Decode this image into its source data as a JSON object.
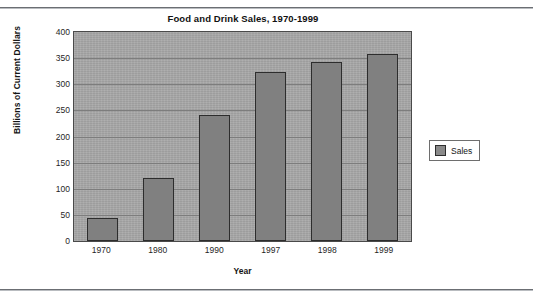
{
  "chart_data": {
    "type": "bar",
    "title": "Food and Drink Sales, 1970-1999",
    "xlabel": "Year",
    "ylabel": "Billions of Current Dollars",
    "categories": [
      "1970",
      "1980",
      "1990",
      "1997",
      "1998",
      "1999"
    ],
    "series": [
      {
        "name": "Sales",
        "values": [
          45,
          121,
          242,
          324,
          343,
          357
        ],
        "color": "#808080"
      }
    ],
    "ylim": [
      0,
      400
    ],
    "yticks": [
      0,
      50,
      100,
      150,
      200,
      250,
      300,
      350,
      400
    ],
    "ytick_labels": [
      "0",
      "50",
      "100",
      "150",
      "200",
      "250",
      "300",
      "350",
      "400"
    ],
    "grid": true,
    "legend_position": "right",
    "plot_background": "#a8a8a8",
    "bar_border_color": "#2d2d2d"
  },
  "legend": {
    "entries": [
      {
        "label": "Sales",
        "swatch_color": "#8a8a8a"
      }
    ]
  }
}
